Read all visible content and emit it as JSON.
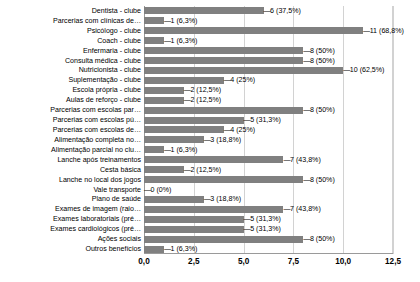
{
  "chart_data": {
    "type": "bar",
    "orientation": "horizontal",
    "title": "",
    "subtitle": "",
    "xlabel": "",
    "ylabel": "",
    "xlim": [
      0.0,
      12.5
    ],
    "xticks": [
      "0,0",
      "2,5",
      "5,0",
      "7,5",
      "10,0",
      "12,5"
    ],
    "xtick_values": [
      0.0,
      2.5,
      5.0,
      7.5,
      10.0,
      12.5
    ],
    "grid": true,
    "legend": false,
    "total_respondents": 16,
    "bar_color": "#808080",
    "gridline_color": "#d2d2d2",
    "axis_color": "#9a9a9a",
    "categories": [
      "Dentista - clube",
      "Parcerias com clínicas de…",
      "Psicólogo - clube",
      "Coach - clube",
      "Enfermaria - clube",
      "Consulta médica - clube",
      "Nutricionista - clube",
      "Suplementação - clube",
      "Escola própria - clube",
      "Aulas de reforço - clube",
      "Parcerias com escolas par…",
      "Parcerias com escolas pú…",
      "Parcerias com escolas de…",
      "Alimentação completa no…",
      "Alimentação parcial no clu…",
      "Lanche após treinamentos",
      "Cesta básica",
      "Lanche no local dos jogos",
      "Vale transporte",
      "Plano de saúde",
      "Exames de imagem (raio…",
      "Exames laboratoriais (pré…",
      "Exames cardiológicos (pré…",
      "Ações sociais",
      "Outros benefícios"
    ],
    "values": [
      6,
      1,
      11,
      1,
      8,
      8,
      10,
      4,
      2,
      2,
      8,
      5,
      4,
      3,
      1,
      7,
      2,
      8,
      0,
      3,
      7,
      5,
      5,
      8,
      1
    ],
    "percents": [
      "37,5%",
      "6,3%",
      "68,8%",
      "6,3%",
      "50%",
      "50%",
      "62,5%",
      "25%",
      "12,5%",
      "12,5%",
      "50%",
      "31,3%",
      "25%",
      "18,8%",
      "6,3%",
      "43,8%",
      "12,5%",
      "50%",
      "0%",
      "18,8%",
      "43,8%",
      "31,3%",
      "31,3%",
      "50%",
      "6,3%"
    ],
    "data_labels": [
      "6 (37,5%)",
      "1 (6,3%)",
      "11 (68,8%)",
      "1 (6,3%)",
      "8 (50%)",
      "8 (50%)",
      "10 (62,5%)",
      "4 (25%)",
      "2 (12,5%)",
      "2 (12,5%)",
      "8 (50%)",
      "5 (31,3%)",
      "4 (25%)",
      "3 (18,8%)",
      "1 (6,3%)",
      "7 (43,8%)",
      "2 (12,5%)",
      "8 (50%)",
      "0 (0%)",
      "3 (18,8%)",
      "7 (43,8%)",
      "5 (31,3%)",
      "5 (31,3%)",
      "8 (50%)",
      "1 (6,3%)"
    ]
  }
}
